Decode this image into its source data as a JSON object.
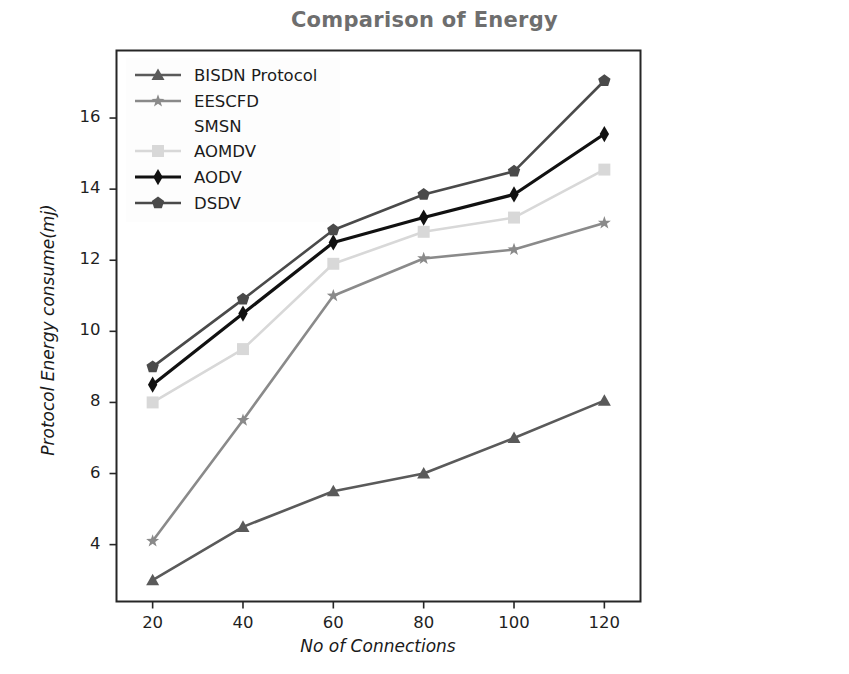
{
  "chart_data": {
    "type": "line",
    "title": "Comparison of Energy",
    "xlabel": "No of Connections",
    "ylabel": "Protocol Energy consume(mj)",
    "x": [
      20,
      40,
      60,
      80,
      100,
      120
    ],
    "xticks": [
      "20",
      "40",
      "60",
      "80",
      "100",
      "120"
    ],
    "yticks": [
      "4",
      "6",
      "8",
      "10",
      "12",
      "14",
      "16"
    ],
    "xlim": [
      12,
      128
    ],
    "ylim": [
      2.4,
      17.9
    ],
    "grid": false,
    "legend_position": "upper left",
    "series": [
      {
        "name": "BISDN Protocol",
        "marker": "triangle",
        "color": "#5a5a5a",
        "values": [
          3.0,
          4.5,
          5.5,
          6.0,
          7.0,
          8.05
        ]
      },
      {
        "name": "EESCFD SMSN",
        "marker": "star",
        "color": "#8a8a8a",
        "values": [
          4.1,
          7.5,
          11.0,
          12.05,
          12.3,
          13.05
        ]
      },
      {
        "name": "AOMDV",
        "marker": "square",
        "color": "#d8d8d8",
        "values": [
          8.0,
          9.5,
          11.9,
          12.8,
          13.2,
          14.55
        ]
      },
      {
        "name": "AODV",
        "marker": "diamond",
        "color": "#111111",
        "values": [
          8.5,
          10.5,
          12.5,
          13.2,
          13.85,
          15.55
        ]
      },
      {
        "name": "DSDV",
        "marker": "pentagon",
        "color": "#4a4a4a",
        "values": [
          9.0,
          10.9,
          12.85,
          13.85,
          14.5,
          17.05
        ]
      }
    ]
  },
  "legend": {
    "entries": [
      {
        "label": "BISDN Protocol",
        "sublabel": ""
      },
      {
        "label": "EESCFD",
        "sublabel": "SMSN"
      },
      {
        "label": "AOMDV",
        "sublabel": ""
      },
      {
        "label": "AODV",
        "sublabel": ""
      },
      {
        "label": "DSDV",
        "sublabel": ""
      }
    ]
  },
  "colors": {
    "title": "#6e6e6e",
    "axis": "#2a2a2a",
    "background": "#ffffff"
  }
}
